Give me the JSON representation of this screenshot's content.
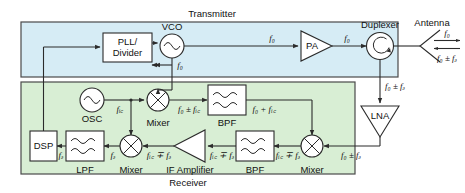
{
  "figure": {
    "type": "block-diagram",
    "sections": [
      {
        "id": "transmitter",
        "label": "Transmitter",
        "fill": "#d6ecf5"
      },
      {
        "id": "receiver",
        "label": "Receiver",
        "fill": "#d8eed4"
      }
    ]
  },
  "transmitter": {
    "label": "Transmitter",
    "blocks": {
      "pll": "PLL/\nDivider",
      "pll_line1": "PLL/",
      "pll_line2": "Divider",
      "vco": "VCO",
      "pa": "PA"
    },
    "signals": {
      "vco_out": "f₀",
      "pll_feedback": "f₀",
      "pa_in": "f₀",
      "pa_out": "f₀"
    }
  },
  "frontend": {
    "duplexer": "Duplexer",
    "antenna": "Antenna",
    "antenna_tx_signal": "f₀",
    "antenna_rx_signal": "f₀ ± fₔ",
    "duplexer_to_lna": "f₀ ± fₔ"
  },
  "receiver": {
    "label": "Receiver",
    "blocks": {
      "lna": "LNA",
      "mixer_rf": "Mixer",
      "bpf_if": "BPF",
      "if_amplifier": "IF Amplifier",
      "mixer_baseband": "Mixer",
      "lpf": "LPF",
      "dsp": "DSP",
      "osc": "OSC",
      "mixer_lo": "Mixer",
      "bpf_lo": "BPF"
    },
    "signals": {
      "lna_out": "f₀ ± fₔ",
      "mixer_rf_out": "fᵢ꜀ ∓ fₔ",
      "bpf_if_out": "fᵢ꜀ ∓ fₔ",
      "if_amp_in": "fᵢ꜀ ∓ fₔ",
      "if_amp_out": "fᵢ꜀ ∓ fₔ",
      "mixer_bb_out": "fₔ",
      "lpf_out": "fₔ",
      "osc_out": "fᵢ꜀",
      "mixer_lo_out": "f₀ ± fᵢ꜀",
      "bpf_lo_out": "f₀ + fᵢ꜀",
      "vco_to_mixer": "f₀"
    }
  },
  "icons": {
    "vco": "sine-wave-circle",
    "osc": "sine-wave-circle",
    "mixer": "crossed-circle",
    "duplexer": "circulator-circle",
    "filter": "wavy-lines",
    "amplifier": "triangle"
  },
  "colors": {
    "transmitter_fill": "#d6ecf5",
    "receiver_fill": "#d8eed4",
    "stroke": "#2b2b2b",
    "box_fill": "#ffffff",
    "background": "#ffffff"
  }
}
